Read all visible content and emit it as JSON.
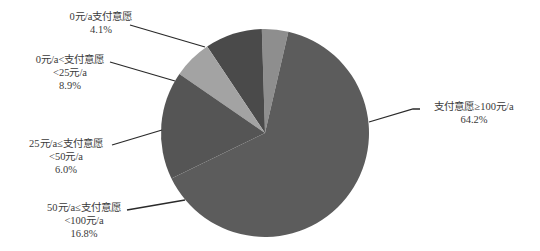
{
  "chart_data": {
    "type": "pie",
    "title": "",
    "categories": [
      "0元/a支付意愿",
      "0元/a<支付意愿<25元/a",
      "25元/a≤支付意愿<50元/a",
      "50元/a≤支付意愿<100元/a",
      "支付意愿≥100元/a"
    ],
    "values": [
      4.1,
      8.9,
      6.0,
      16.8,
      64.2
    ],
    "unit": "%",
    "colors": [
      "#8e8e8e",
      "#4a4a4a",
      "#a3a3a3",
      "#555555",
      "#5c5c5c"
    ],
    "legend": "none (leader-line labels)"
  },
  "labels": [
    {
      "line1": "0元/a支付意愿",
      "line2": "",
      "pct": "4.1%"
    },
    {
      "line1": "0元/a<支付意愿",
      "line2": "<25元/a",
      "pct": "8.9%"
    },
    {
      "line1": "25元/a≤支付意愿",
      "line2": "<50元/a",
      "pct": "6.0%"
    },
    {
      "line1": "50元/a≤支付意愿",
      "line2": "<100元/a",
      "pct": "16.8%"
    },
    {
      "line1": "支付意愿≥100元/a",
      "line2": "",
      "pct": "64.2%"
    }
  ]
}
